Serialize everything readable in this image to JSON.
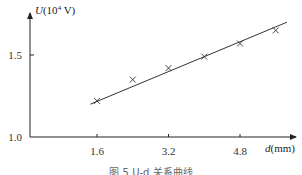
{
  "chart_data": {
    "type": "scatter",
    "title": "",
    "xlabel": "d(mm)",
    "ylabel": "U(10^4 V)",
    "xlabel_parts": {
      "var": "d",
      "unit": "(mm)"
    },
    "ylabel_parts": {
      "var": "U",
      "pre": "(10",
      "exp": "4",
      "post": " V)"
    },
    "x_ticks": [
      1.6,
      3.2,
      4.8
    ],
    "x_tick_labels": [
      "1.6",
      "3.2",
      "4.8"
    ],
    "y_ticks": [
      1.0,
      1.5
    ],
    "y_tick_labels": [
      "1.0",
      "1.5"
    ],
    "xlim": [
      0,
      6.0
    ],
    "ylim": [
      1.0,
      1.75
    ],
    "grid": false,
    "legend": null,
    "series": [
      {
        "name": "measured",
        "marker": "x",
        "x": [
          1.6,
          2.4,
          3.2,
          4.0,
          4.8,
          5.6
        ],
        "y": [
          1.22,
          1.35,
          1.42,
          1.49,
          1.57,
          1.65
        ]
      },
      {
        "name": "fit line",
        "type": "line",
        "x": [
          1.45,
          5.85
        ],
        "y": [
          1.2,
          1.7
        ]
      }
    ],
    "caption": "图 5  U-d 关系曲线"
  }
}
